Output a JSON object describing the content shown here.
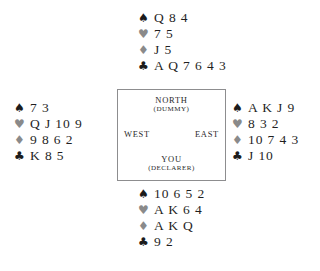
{
  "diagram": {
    "type": "bridge-hand-diagram",
    "suit_symbols": {
      "spade": "♠",
      "heart": "♥",
      "diamond": "♦",
      "club": "♣"
    },
    "suit_colors": {
      "spade": "#1c1c1c",
      "heart": "#8a8a8a",
      "diamond": "#8a8a8a",
      "club": "#1c1c1c"
    },
    "box_border_color": "#8d8d8f",
    "background_color": "#ffffff"
  },
  "compass": {
    "north": "NORTH",
    "north_role": "(DUMMY)",
    "west": "WEST",
    "east": "EAST",
    "south": "YOU",
    "south_role": "(DECLARER)"
  },
  "hands": {
    "north": {
      "position": "North",
      "spades": "Q 8 4",
      "hearts": "7 5",
      "diamonds": "J 5",
      "clubs": "A Q 7 6 4 3"
    },
    "west": {
      "position": "West",
      "spades": "7 3",
      "hearts": "Q J 10 9",
      "diamonds": "9 8 6 2",
      "clubs": "K 8 5"
    },
    "east": {
      "position": "East",
      "spades": "A K J 9",
      "hearts": "8 3 2",
      "diamonds": "10 7 4 3",
      "clubs": "J 10"
    },
    "south": {
      "position": "South",
      "spades": "10 6 5 2",
      "hearts": "A K 6 4",
      "diamonds": "A K Q",
      "clubs": "9 2"
    }
  }
}
